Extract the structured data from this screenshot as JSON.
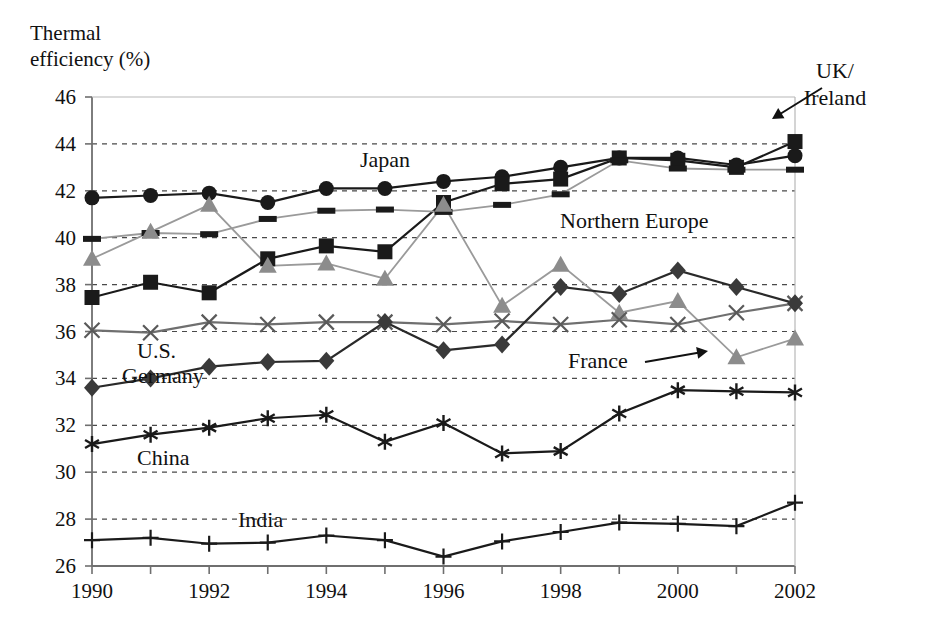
{
  "chart_data": {
    "type": "line",
    "title": "",
    "ylabel_line1": "Thermal",
    "ylabel_line2": "efficiency (%)",
    "xlabel": "",
    "grid": true,
    "legend_position": "inline-annotations",
    "ylim": [
      26,
      46
    ],
    "ytick_step": 2,
    "xlim": [
      1990,
      2002
    ],
    "x": [
      1990,
      1991,
      1992,
      1993,
      1994,
      1995,
      1996,
      1997,
      1998,
      1999,
      2000,
      2001,
      2002
    ],
    "ytick_labels": [
      "26",
      "28",
      "30",
      "32",
      "34",
      "36",
      "38",
      "40",
      "42",
      "44",
      "46"
    ],
    "xtick_labels": [
      "1990",
      "1992",
      "1994",
      "1996",
      "1998",
      "2000",
      "2002"
    ],
    "xtick_label_years": [
      1990,
      1992,
      1994,
      1996,
      1998,
      2000,
      2002
    ],
    "series": [
      {
        "name": "Japan",
        "marker": "circle",
        "color": "#1a1a1a",
        "line_color": "#1a1a1a",
        "values": [
          41.7,
          41.8,
          41.9,
          41.5,
          42.1,
          42.1,
          42.4,
          42.6,
          43.0,
          43.4,
          43.4,
          43.1,
          43.5
        ]
      },
      {
        "name": "UK/ Ireland",
        "label_line1": "UK/",
        "label_line2": "Ireland",
        "marker": "square",
        "color": "#1a1a1a",
        "line_color": "#1a1a1a",
        "values": [
          37.45,
          38.1,
          37.65,
          39.1,
          39.65,
          39.4,
          41.5,
          42.3,
          42.5,
          43.4,
          43.3,
          43.0,
          44.1
        ]
      },
      {
        "name": "Northern Europe",
        "marker": "dash",
        "color": "#1a1a1a",
        "line_color": "#9a9a9a",
        "values": [
          39.95,
          40.2,
          40.15,
          40.8,
          41.15,
          41.2,
          41.1,
          41.4,
          41.85,
          43.3,
          42.95,
          42.9,
          42.9
        ]
      },
      {
        "name": "France",
        "marker": "triangle",
        "color": "#8c8c8c",
        "line_color": "#9a9a9a",
        "values": [
          39.1,
          40.25,
          41.4,
          38.8,
          38.9,
          38.25,
          41.4,
          37.1,
          38.85,
          36.8,
          37.3,
          34.9,
          35.7
        ]
      },
      {
        "name": "U.S.",
        "marker": "x",
        "color": "#5a5a5a",
        "line_color": "#6f6f6f",
        "values": [
          36.05,
          35.95,
          36.4,
          36.3,
          36.4,
          36.4,
          36.3,
          36.45,
          36.3,
          36.5,
          36.3,
          36.8,
          37.2
        ]
      },
      {
        "name": "Germany",
        "marker": "diamond",
        "color": "#3a3a3a",
        "line_color": "#2a2a2a",
        "values": [
          33.6,
          34.0,
          34.5,
          34.7,
          34.75,
          36.4,
          35.2,
          35.45,
          37.9,
          37.6,
          38.6,
          37.9,
          37.2
        ]
      },
      {
        "name": "China",
        "marker": "asterisk",
        "color": "#1a1a1a",
        "line_color": "#1a1a1a",
        "values": [
          31.2,
          31.6,
          31.9,
          32.3,
          32.45,
          31.3,
          32.1,
          30.8,
          30.9,
          32.5,
          33.5,
          33.45,
          33.4
        ]
      },
      {
        "name": "India",
        "marker": "plus",
        "color": "#1a1a1a",
        "line_color": "#1a1a1a",
        "values": [
          27.1,
          27.2,
          26.95,
          27.0,
          27.3,
          27.1,
          26.4,
          27.05,
          27.45,
          27.85,
          27.8,
          27.7,
          28.7
        ]
      }
    ],
    "annotations": [
      {
        "name": "japan",
        "text": "Japan",
        "x": 360,
        "y": 167
      },
      {
        "name": "northern-europe",
        "text": "Northern Europe",
        "x": 560,
        "y": 228
      },
      {
        "name": "france",
        "text": "France",
        "x": 568,
        "y": 368
      },
      {
        "name": "us",
        "text": "U.S.",
        "x": 137,
        "y": 358
      },
      {
        "name": "germany",
        "text": "Germany",
        "x": 122,
        "y": 383
      },
      {
        "name": "china",
        "text": "China",
        "x": 137,
        "y": 465
      },
      {
        "name": "india",
        "text": "India",
        "x": 238,
        "y": 527
      },
      {
        "name": "uk-ireland-1",
        "text": "UK/",
        "x": 835,
        "y": 78
      },
      {
        "name": "uk-ireland-2",
        "text": "Ireland",
        "x": 835,
        "y": 105
      }
    ]
  },
  "colors": {
    "axis": "#6f6f6f",
    "grid": "#4a4a4a",
    "text": "#111111",
    "background": "#ffffff"
  }
}
